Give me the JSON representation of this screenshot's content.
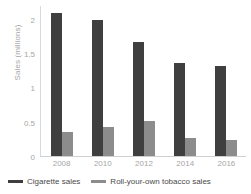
{
  "chart_data": {
    "type": "bar",
    "title": "",
    "subtitle": "",
    "xlabel": "",
    "ylabel": "Sales (millions)",
    "categories": [
      "2008",
      "2010",
      "2012",
      "2014",
      "2016"
    ],
    "series": [
      {
        "name": "Cigarette sales",
        "color": "#3f3f3f",
        "values": [
          2.1,
          2.0,
          1.67,
          1.37,
          1.32
        ]
      },
      {
        "name": "Roll-your-own tobacco sales",
        "color": "#8c8c8c",
        "values": [
          0.35,
          0.43,
          0.51,
          0.26,
          0.24
        ]
      }
    ],
    "ylim": [
      0,
      2.2
    ],
    "yticks": [
      "0",
      "0.5",
      "1",
      "1.5",
      "2"
    ],
    "ytick_values": [
      0,
      0.5,
      1,
      1.5,
      2
    ],
    "grid": false,
    "legend_position": "bottom"
  },
  "colors": {
    "series_0": "#3f3f3f",
    "series_1": "#8c8c8c",
    "tick_label": "#a6a6a6",
    "legend_label": "#4a4a4a",
    "axis_line": "#d0d0d0",
    "background": "#ffffff"
  }
}
